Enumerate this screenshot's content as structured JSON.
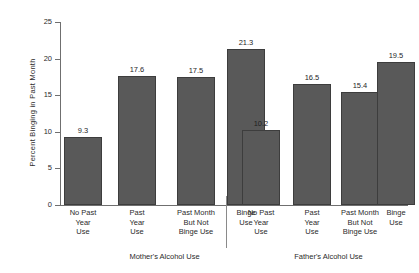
{
  "chart_data": {
    "type": "bar",
    "title": "",
    "xlabel": "",
    "ylabel": "Percent Binging in Past Month",
    "ylim": [
      0,
      25
    ],
    "yticks": [
      0,
      5,
      10,
      15,
      20,
      25
    ],
    "ytick_labels": [
      "0",
      "5",
      "10",
      "15",
      "20",
      "25"
    ],
    "grid": false,
    "legend": "none",
    "categories": [
      "No Past Year Use",
      "Past Year Use",
      "Past Month But Not Binge Use",
      "Binge Use"
    ],
    "groups": [
      {
        "name": "Mother's Alcohol Use",
        "caption": "Mother's Alcohol Use",
        "values": [
          9.3,
          17.6,
          17.5,
          21.3
        ],
        "value_labels": [
          "9.3",
          "17.6",
          "17.5",
          "21.3"
        ]
      },
      {
        "name": "Father's Alcohol Use",
        "caption": "Father's Alcohol Use",
        "values": [
          10.2,
          16.5,
          15.4,
          19.5
        ],
        "value_labels": [
          "10.2",
          "16.5",
          "15.4",
          "19.5"
        ]
      }
    ],
    "bar_color": "#595959",
    "bar_edge_color": "#3d3d3d",
    "axis_color": "#6f6f6f"
  },
  "axis": {
    "y_title": "Percent Binging in Past Month",
    "ticks": [
      {
        "label": "25",
        "value": 25
      },
      {
        "label": "20",
        "value": 20
      },
      {
        "label": "15",
        "value": 15
      },
      {
        "label": "10",
        "value": 10
      },
      {
        "label": "5",
        "value": 5
      },
      {
        "label": "0",
        "value": 0
      }
    ]
  },
  "categories_lines": [
    [
      "No Past",
      "Year",
      "Use"
    ],
    [
      "Past",
      "Year",
      "Use"
    ],
    [
      "Past Month",
      "But Not",
      "Binge Use"
    ],
    [
      "Binge",
      "Use"
    ]
  ],
  "captions": {
    "left": "Mother's Alcohol Use",
    "right": "Father's Alcohol Use"
  }
}
